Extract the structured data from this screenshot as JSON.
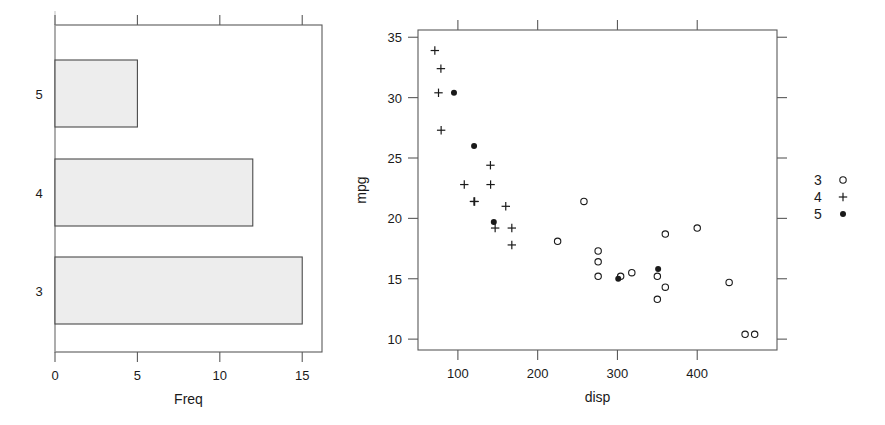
{
  "figure": {
    "background": "#ffffff",
    "ink": "#1a1a1a",
    "axis_color": "#5a5a5a",
    "bar_fill": "#ededed"
  },
  "chart_data": [
    {
      "type": "bar",
      "orientation": "horizontal",
      "title": "",
      "categories": [
        "3",
        "4",
        "5"
      ],
      "values": [
        15,
        12,
        5
      ],
      "xlabel": "Freq",
      "ylabel": "",
      "xlim": [
        0,
        16.2
      ],
      "xticks": [
        0,
        5,
        10,
        15
      ],
      "xtick_labels": [
        "0",
        "5",
        "10",
        "15"
      ],
      "ytick_labels": [
        "3",
        "4",
        "5"
      ],
      "grid": false,
      "legend": "none"
    },
    {
      "type": "scatter",
      "title": "",
      "xlabel": "disp",
      "ylabel": "mpg",
      "xlim": [
        50,
        500
      ],
      "ylim": [
        9.1,
        35.6
      ],
      "xticks": [
        100,
        200,
        300,
        400
      ],
      "xtick_labels": [
        "100",
        "200",
        "300",
        "400"
      ],
      "yticks": [
        10,
        15,
        20,
        25,
        30,
        35
      ],
      "ytick_labels": [
        "10",
        "15",
        "20",
        "25",
        "30",
        "35"
      ],
      "grid": false,
      "legend_position": "right-outside",
      "legend_title": "",
      "series": [
        {
          "name": "3",
          "marker": "open-circle",
          "points": [
            [
              258,
              21.4
            ],
            [
              225,
              18.1
            ],
            [
              360,
              18.7
            ],
            [
              360,
              14.3
            ],
            [
              275.8,
              17.3
            ],
            [
              275.8,
              16.4
            ],
            [
              275.8,
              15.2
            ],
            [
              472,
              10.4
            ],
            [
              460,
              10.4
            ],
            [
              440,
              14.7
            ],
            [
              318,
              15.5
            ],
            [
              304,
              15.2
            ],
            [
              350,
              13.3
            ],
            [
              400,
              19.2
            ],
            [
              350,
              15.2
            ]
          ]
        },
        {
          "name": "4",
          "marker": "plus",
          "points": [
            [
              108,
              22.8
            ],
            [
              146.7,
              19.2
            ],
            [
              140.8,
              24.4
            ],
            [
              167.6,
              19.2
            ],
            [
              167.6,
              17.8
            ],
            [
              71.1,
              33.9
            ],
            [
              78.7,
              32.4
            ],
            [
              75.7,
              30.4
            ],
            [
              79,
              27.3
            ],
            [
              120.1,
              21.4
            ],
            [
              121,
              21.4
            ],
            [
              141,
              22.8
            ],
            [
              160,
              21.0
            ]
          ]
        },
        {
          "name": "5",
          "marker": "solid-circle",
          "points": [
            [
              95.1,
              30.4
            ],
            [
              120.3,
              26.0
            ],
            [
              145,
              19.7
            ],
            [
              301,
              15.0
            ],
            [
              351,
              15.8
            ]
          ]
        }
      ]
    }
  ],
  "legend": {
    "entries": [
      {
        "label": "3",
        "marker": "open-circle"
      },
      {
        "label": "4",
        "marker": "plus"
      },
      {
        "label": "5",
        "marker": "solid-circle"
      }
    ]
  }
}
